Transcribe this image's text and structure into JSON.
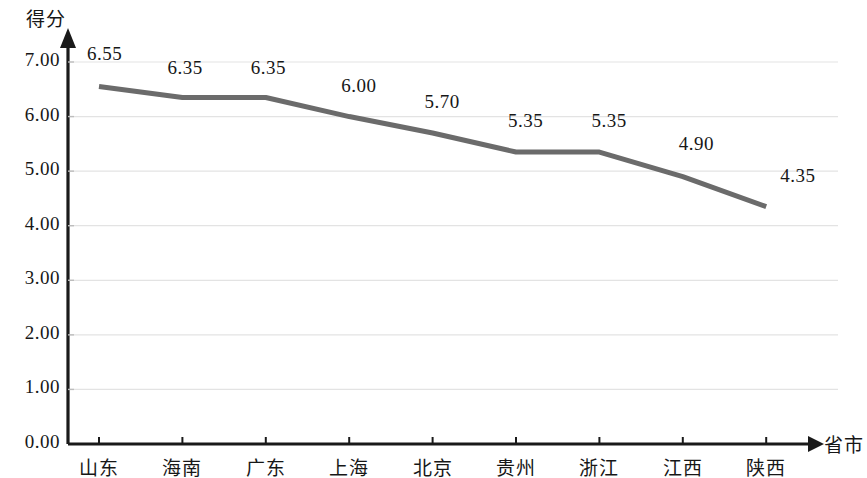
{
  "chart_data": {
    "type": "line",
    "title": "",
    "xlabel": "省市",
    "ylabel": "得分",
    "categories": [
      "山东",
      "海南",
      "广东",
      "上海",
      "北京",
      "贵州",
      "浙江",
      "江西",
      "陕西"
    ],
    "values": [
      6.55,
      6.35,
      6.35,
      6.0,
      5.7,
      5.35,
      5.35,
      4.9,
      4.35
    ],
    "point_labels": [
      "6.55",
      "6.35",
      "6.35",
      "6.00",
      "5.70",
      "5.35",
      "5.35",
      "4.90",
      "4.35"
    ],
    "ylim": [
      0.0,
      7.0
    ],
    "ytick_labels": [
      "7.00",
      "6.00",
      "5.00",
      "4.00",
      "3.00",
      "2.00",
      "1.00",
      "0.00"
    ],
    "ytick_values": [
      7.0,
      6.0,
      5.0,
      4.0,
      3.0,
      2.0,
      1.0,
      0.0
    ],
    "grid": true,
    "legend": "none",
    "series_color": "#6b6b6b",
    "grid_color": "#e3e3e3",
    "axis_color": "#1a1a1a"
  }
}
